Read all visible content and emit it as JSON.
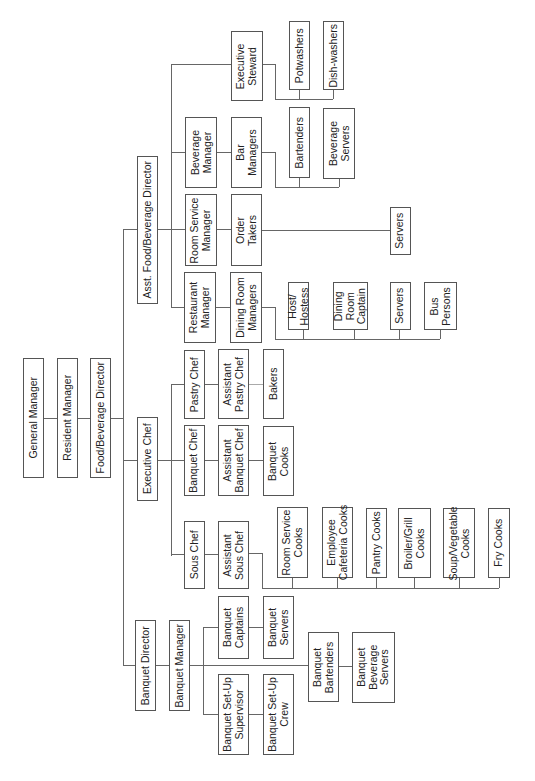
{
  "nodes": {
    "general_manager": "General Manager",
    "resident_manager": "Resident Manager",
    "fb_director": "Food/Beverage Director",
    "asst_fb_director": "Asst. Food/Beverage Director",
    "executive_chef": "Executive Chef",
    "banquet_director": "Banquet Director",
    "banquet_manager": "Banquet Manager",
    "restaurant_manager": "Restaurant\nManager",
    "dining_room_managers": "Dining Room\nManagers",
    "host_hostess": "Host/\nHostess",
    "dining_room_captain": "Dining\nRoom\nCaptain",
    "dr_servers": "Servers",
    "bus_persons": "Bus\nPersons",
    "room_service_manager": "Room Service\nManager",
    "order_takers": "Order\nTakers",
    "rs_servers": "Servers",
    "beverage_manager": "Beverage\nManager",
    "bar_managers": "Bar\nManagers",
    "bartenders": "Bartenders",
    "beverage_servers": "Beverage\nServers",
    "executive_steward": "Executive\nSteward",
    "potwashers": "Potwashers",
    "dishwashers": "Dish-washers",
    "pastry_chef": "Pastry Chef",
    "asst_pastry_chef": "Assistant\nPastry Chef",
    "bakers": "Bakers",
    "banquet_chef": "Banquet Chef",
    "asst_banquet_chef": "Assistant\nBanquet Chef",
    "banquet_cooks": "Banquet\nCooks",
    "sous_chef": "Sous Chef",
    "asst_sous_chef": "Assistant\nSous Chef",
    "room_service_cooks": "Room Service\nCooks",
    "employee_cafeteria_cooks": "Employee\nCafeteria Cooks",
    "pantry_cooks": "Pantry Cooks",
    "broiler_grill_cooks": "Broiler/Grill\nCooks",
    "soup_vegetable_cooks": "Soup/Vegetable\nCooks",
    "fry_cooks": "Fry Cooks",
    "banquet_captains": "Banquet\nCaptains",
    "banquet_servers": "Banquet\nServers",
    "banquet_bartenders": "Banquet\nBartenders",
    "banquet_beverage_servers": "Banquet\nBeverage\nServers",
    "banquet_setup_supervisor": "Banquet Set-Up\nSupervisor",
    "banquet_setup_crew": "Banquet Set-Up\nCrew"
  },
  "orientation": "rotated-90-ccw",
  "colors": {
    "line": "#666666",
    "border": "#555555",
    "text": "#222222",
    "background": "#ffffff"
  }
}
